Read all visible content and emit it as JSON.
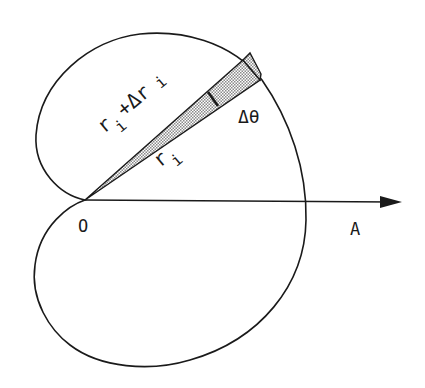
{
  "diagram": {
    "type": "polar-area-element",
    "labels": {
      "origin": "O",
      "axis": "A",
      "angle_increment": "Δθ",
      "inner_radius_main": "r",
      "inner_radius_sub": "i",
      "outer_radius_r": "r",
      "outer_radius_sub1": "i",
      "outer_radius_plus": "+Δr",
      "outer_radius_sub2": "i"
    },
    "colors": {
      "ink": "#1a1a1a",
      "background": "#ffffff",
      "shading": "#9a9a9a"
    }
  }
}
